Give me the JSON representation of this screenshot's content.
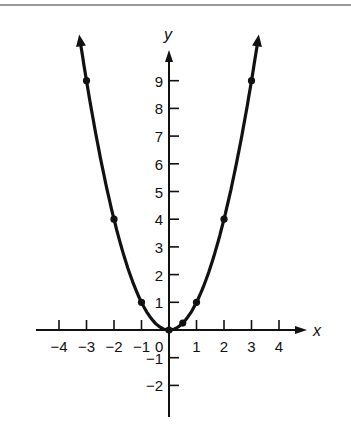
{
  "chart_data": {
    "type": "line",
    "title": "",
    "xlabel": "x",
    "ylabel": "y",
    "function": "y = x^2",
    "xlim": [
      -4.8,
      5
    ],
    "ylim": [
      -3.1,
      10.5
    ],
    "grid": false,
    "legend": null,
    "x_ticks": [
      -4,
      -3,
      -2,
      -1,
      1,
      2,
      3,
      4
    ],
    "x_tick_labels": [
      "−4",
      "−3",
      "−2",
      "−1",
      "1",
      "2",
      "3",
      "4"
    ],
    "origin_label": "0",
    "y_ticks": [
      -2,
      -1,
      1,
      2,
      3,
      4,
      5,
      6,
      7,
      8,
      9
    ],
    "y_tick_labels": [
      "−2",
      "−1",
      "1",
      "2",
      "3",
      "4",
      "5",
      "6",
      "7",
      "8",
      "9"
    ],
    "series": [
      {
        "name": "parabola",
        "x": [
          -3,
          -2,
          -1,
          0,
          0.5,
          1,
          2,
          3
        ],
        "y": [
          9,
          4,
          1,
          0,
          0.25,
          1,
          4,
          9
        ],
        "marked_points": true,
        "arrows_at_ends": true
      }
    ],
    "colors": {
      "curve": "#111111",
      "axes": "#111111",
      "top_rule": "#777777"
    }
  }
}
